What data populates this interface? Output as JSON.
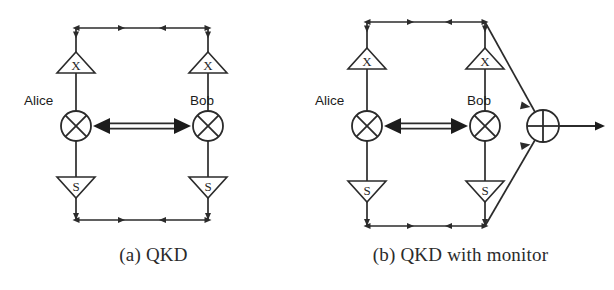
{
  "figure": {
    "background_color": "#ffffff",
    "line_color": "#2b2b2b",
    "panels": [
      {
        "id": "a",
        "caption": "(a) QKD",
        "nodes": {
          "alice_label": "Alice",
          "bob_label": "Bob",
          "alice_gate_top": "X",
          "alice_gate_bottom": "S",
          "bob_gate_top": "X",
          "bob_gate_bottom": "S",
          "alice_mixer_symbol": "crossed-circle",
          "bob_mixer_symbol": "crossed-circle"
        },
        "channel": {
          "type": "double-headed-arrow",
          "name": "quantum-channel"
        }
      },
      {
        "id": "b",
        "caption": "(b) QKD with monitor",
        "nodes": {
          "alice_label": "Alice",
          "bob_label": "Bob",
          "alice_gate_top": "X",
          "alice_gate_bottom": "S",
          "bob_gate_top": "X",
          "bob_gate_bottom": "S",
          "alice_mixer_symbol": "crossed-circle",
          "bob_mixer_symbol": "crossed-circle",
          "monitor_symbol": "plus-circle"
        },
        "channel": {
          "type": "double-headed-arrow",
          "name": "quantum-channel"
        },
        "monitor_output": {
          "type": "arrow",
          "name": "monitor-output"
        }
      }
    ]
  }
}
